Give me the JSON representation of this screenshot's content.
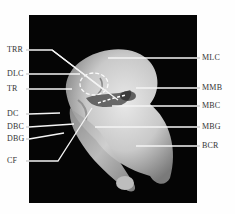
{
  "figure": {
    "background_color": "#050505",
    "line_color": "#ffffff",
    "labels_left": [
      {
        "text": "TRR",
        "y": 50
      },
      {
        "text": "DLC",
        "y": 74
      },
      {
        "text": "TR",
        "y": 89
      },
      {
        "text": "DC",
        "y": 114
      },
      {
        "text": "DBC",
        "y": 127
      },
      {
        "text": "DBG",
        "y": 139
      },
      {
        "text": "CF",
        "y": 161
      }
    ],
    "labels_right": [
      {
        "text": "MLC",
        "y": 58
      },
      {
        "text": "MMB",
        "y": 88
      },
      {
        "text": "MBC",
        "y": 106
      },
      {
        "text": "MBG",
        "y": 127
      },
      {
        "text": "BCR",
        "y": 146
      }
    ]
  }
}
